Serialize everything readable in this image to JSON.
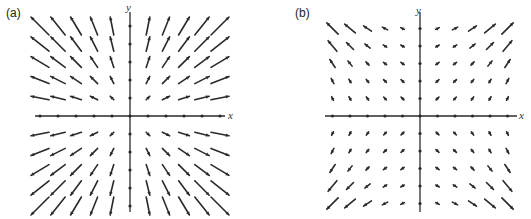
{
  "figure": {
    "panels": [
      {
        "id": "a",
        "label": "(a)",
        "x_axis_label": "x",
        "y_axis_label": "y",
        "field": "radial",
        "description": "Vector field with arrows pointing radially outward from the origin, lengths growing with distance"
      },
      {
        "id": "b",
        "label": "(b)",
        "x_axis_label": "x",
        "y_axis_label": "y",
        "field": "cubic",
        "description": "Vector field with short arrows near the origin, arrows pointing outward and growing rapidly toward the corners"
      }
    ]
  },
  "chart_data": [
    {
      "type": "quiver",
      "title": "(a)",
      "xlabel": "x",
      "ylabel": "y",
      "grid": false,
      "x": [
        -5,
        -4,
        -3,
        -2,
        -1,
        0,
        1,
        2,
        3,
        4,
        5
      ],
      "y": [
        -5,
        -4,
        -3,
        -2,
        -1,
        0,
        1,
        2,
        3,
        4,
        5
      ],
      "vector_rule": "F(x, y) = (x, y)"
    },
    {
      "type": "quiver",
      "title": "(b)",
      "xlabel": "x",
      "ylabel": "y",
      "grid": false,
      "x": [
        -5,
        -4,
        -3,
        -2,
        -1,
        0,
        1,
        2,
        3,
        4,
        5
      ],
      "y": [
        -5,
        -4,
        -3,
        -2,
        -1,
        0,
        1,
        2,
        3,
        4,
        5
      ],
      "vector_rule": "arrows small near origin, growing outward toward corners"
    }
  ],
  "colors": {
    "ink": "#2a2a2a",
    "background": "#ffffff"
  }
}
